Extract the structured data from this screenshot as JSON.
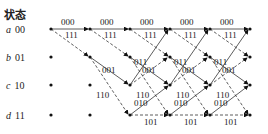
{
  "title": "状态",
  "states": [
    {
      "letter": "a",
      "code": "00"
    },
    {
      "letter": "b",
      "code": "01"
    },
    {
      "letter": "c",
      "code": "10"
    },
    {
      "letter": "d",
      "code": "11"
    }
  ],
  "branch_labels": {
    "a_to_a": "000",
    "a_to_b": "111",
    "b_to_c": "001",
    "b_to_d": "110",
    "c_to_a": "011",
    "c_to_b": "100",
    "d_to_c": "010",
    "d_to_d": "101"
  },
  "legend": {
    "solid": "input 0",
    "dashed": "input 1"
  }
}
